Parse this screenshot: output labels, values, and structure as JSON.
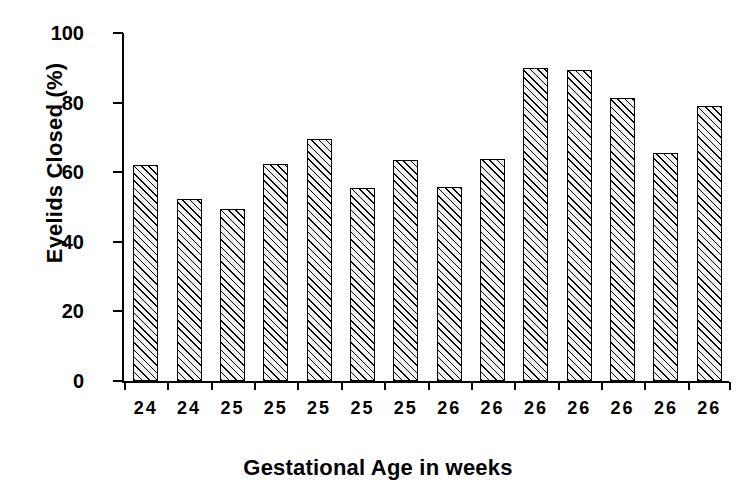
{
  "chart_data": {
    "type": "bar",
    "title": "",
    "xlabel": "Gestational Age in weeks",
    "ylabel": "Eyelids Closed (%)",
    "categories": [
      "24",
      "24",
      "25",
      "25",
      "25",
      "25",
      "25",
      "26",
      "26",
      "26",
      "26",
      "26",
      "26",
      "26"
    ],
    "values": [
      62.2,
      52.3,
      49.5,
      62.5,
      69.4,
      55.5,
      63.4,
      55.8,
      63.7,
      89.8,
      89.3,
      81.4,
      65.4,
      79.0
    ],
    "ylim": [
      0,
      100
    ],
    "yticks": [
      0,
      20,
      40,
      60,
      80,
      100
    ],
    "ytick_labels": [
      "0",
      "20",
      "40",
      "60",
      "80",
      "100"
    ],
    "grid": false,
    "legend": false,
    "bar_fill": "#f2f2f2",
    "bar_edge": "#000000",
    "bar_hatch": "diagonal-lines"
  }
}
